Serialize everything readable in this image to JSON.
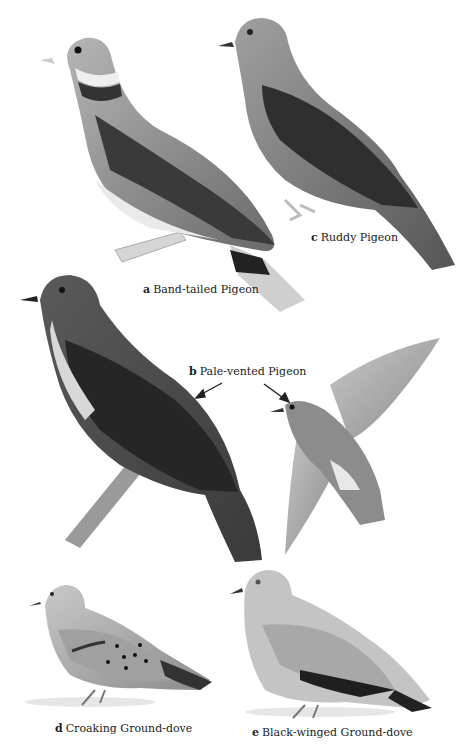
{
  "plate": {
    "species": [
      {
        "letter": "a",
        "name": "Band-tailed Pigeon"
      },
      {
        "letter": "b",
        "name": "Pale-vented Pigeon"
      },
      {
        "letter": "c",
        "name": "Ruddy Pigeon"
      },
      {
        "letter": "d",
        "name": "Croaking Ground-dove"
      },
      {
        "letter": "e",
        "name": "Black-winged Ground-dove"
      }
    ],
    "colors": {
      "background": "#ffffff",
      "body_mid": "#8a8a8a",
      "body_dark": "#4a4a4a",
      "body_light": "#bdbdbd",
      "wing_dark": "#2e2e2e",
      "text": "#222222"
    }
  }
}
